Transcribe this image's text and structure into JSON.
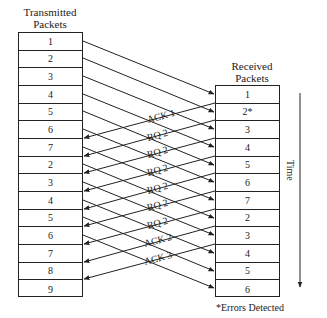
{
  "diagram": {
    "transmitted": {
      "title_line1": "Transmitted",
      "title_line2": "Packets",
      "packets": [
        "1",
        "2",
        "3",
        "4",
        "5",
        "6",
        "7",
        "2",
        "3",
        "4",
        "5",
        "6",
        "7",
        "8",
        "9"
      ]
    },
    "received": {
      "title_line1": "Received",
      "title_line2": "Packets",
      "packets": [
        "1",
        "2*",
        "3",
        "4",
        "5",
        "6",
        "7",
        "2",
        "3",
        "4",
        "5",
        "6"
      ]
    },
    "responses": [
      "ACK 1",
      "RQ 2",
      "RQ 2",
      "RQ 2",
      "RQ 2",
      "RQ 2",
      "RQ 2",
      "ACK 2",
      "ACK 3"
    ],
    "time_label": "Time",
    "footnote": "*Errors Detected",
    "colors": {
      "line": "#222222",
      "text": "#1a1a1a",
      "background": "#ffffff"
    }
  }
}
